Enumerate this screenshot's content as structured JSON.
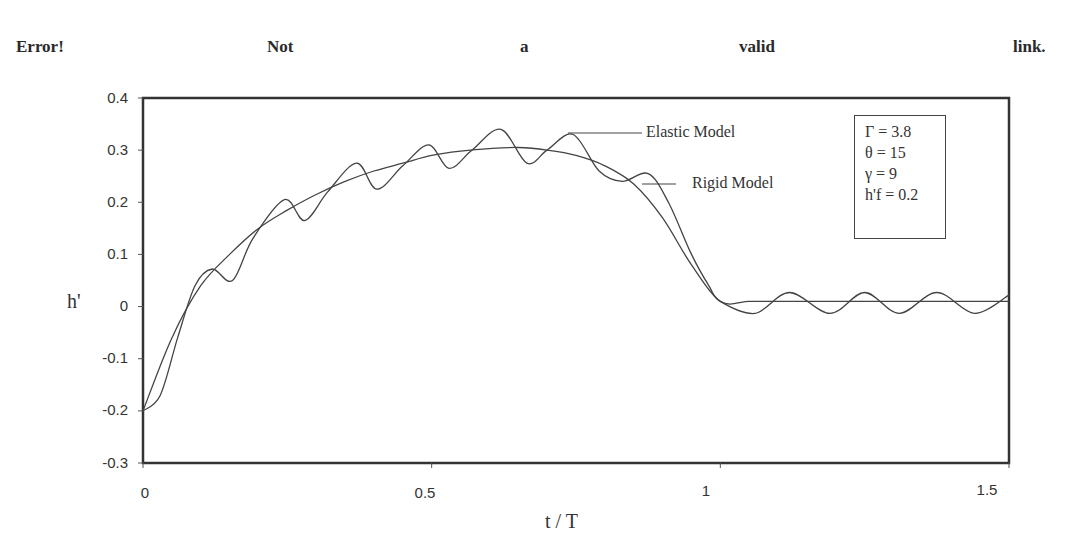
{
  "header": {
    "words": [
      "Error!",
      "Not",
      "a",
      "valid",
      "link."
    ]
  },
  "chart_data": {
    "type": "line",
    "title": "",
    "xlabel": "t / T",
    "ylabel": "h'",
    "xlim": [
      0,
      1.5
    ],
    "ylim": [
      -0.3,
      0.4
    ],
    "grid": false,
    "x_ticks": [
      "0",
      "0.5",
      "1",
      "1.5"
    ],
    "y_ticks": [
      "0.4",
      "0.3",
      "0.2",
      "0.1",
      "0",
      "-0.1",
      "-0.2",
      "-0.3"
    ],
    "legend_position": "inline labels with leader lines, upper right",
    "annotation_box": [
      "Γ = 3.8",
      "θ = 15",
      "γ = 9",
      "h'f = 0.2"
    ],
    "series": [
      {
        "name": "Rigid Model",
        "x": [
          0,
          0.05,
          0.1,
          0.15,
          0.2,
          0.25,
          0.3,
          0.35,
          0.4,
          0.45,
          0.5,
          0.55,
          0.6,
          0.65,
          0.7,
          0.75,
          0.8,
          0.85,
          0.9,
          0.95,
          1.0,
          1.05,
          1.1,
          1.2,
          1.3,
          1.4,
          1.5
        ],
        "values": [
          -0.2,
          -0.06,
          0.04,
          0.1,
          0.15,
          0.185,
          0.215,
          0.24,
          0.26,
          0.275,
          0.29,
          0.298,
          0.303,
          0.305,
          0.3,
          0.29,
          0.27,
          0.235,
          0.17,
          0.08,
          0.01,
          0.01,
          0.01,
          0.01,
          0.01,
          0.01,
          0.01
        ]
      },
      {
        "name": "Elastic Model",
        "x": [
          0,
          0.03,
          0.06,
          0.09,
          0.12,
          0.155,
          0.19,
          0.245,
          0.28,
          0.32,
          0.37,
          0.405,
          0.45,
          0.495,
          0.53,
          0.57,
          0.62,
          0.665,
          0.7,
          0.745,
          0.79,
          0.83,
          0.875,
          0.91,
          0.95,
          0.98,
          1.0,
          1.06,
          1.12,
          1.19,
          1.25,
          1.31,
          1.375,
          1.44,
          1.5
        ],
        "values": [
          -0.2,
          -0.17,
          -0.06,
          0.04,
          0.072,
          0.05,
          0.13,
          0.205,
          0.165,
          0.22,
          0.275,
          0.225,
          0.27,
          0.31,
          0.265,
          0.3,
          0.34,
          0.275,
          0.3,
          0.33,
          0.26,
          0.24,
          0.255,
          0.2,
          0.1,
          0.04,
          0.01,
          -0.013,
          0.027,
          -0.013,
          0.027,
          -0.013,
          0.027,
          -0.013,
          0.022
        ]
      }
    ]
  },
  "labels": {
    "elastic": "Elastic Model",
    "rigid": "Rigid Model",
    "xlabel": "t / T",
    "ylabel": "h'"
  },
  "colors": {
    "line": "#444444",
    "axis": "#333333",
    "text": "#333333"
  }
}
